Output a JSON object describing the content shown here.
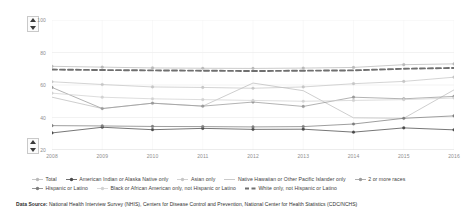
{
  "chart_data": {
    "type": "line",
    "title": "",
    "xlabel": "",
    "ylabel": "percent",
    "ylim": [
      20,
      100
    ],
    "yticks": [
      20,
      40,
      60,
      80,
      100
    ],
    "grid": true,
    "legend_position": "bottom",
    "categories": [
      "2008",
      "2009",
      "2010",
      "2011",
      "2012",
      "2013",
      "2014",
      "2015",
      "2016"
    ],
    "series": [
      {
        "name": "Total",
        "color": "#b9b9b9",
        "marker": "circle",
        "style": "solid",
        "values": [
          71.5,
          71.0,
          70.5,
          70.3,
          70.2,
          70.4,
          70.8,
          72.5,
          73.0
        ]
      },
      {
        "name": "American Indian or Alaska Native only",
        "color": "#4a4a4a",
        "marker": "circle",
        "style": "solid",
        "values": [
          30.5,
          34.0,
          32.5,
          33.3,
          32.7,
          32.8,
          31.0,
          33.6,
          32.4
        ]
      },
      {
        "name": "Asian only",
        "color": "#c6c6c6",
        "marker": "circle",
        "style": "solid",
        "values": [
          62.0,
          60.3,
          58.8,
          58.5,
          58.0,
          58.8,
          60.8,
          62.2,
          64.8
        ]
      },
      {
        "name": "Native Hawaiian or Other Pacific Islander only",
        "color": "#bdbdbd",
        "marker": "none",
        "style": "solid",
        "values": [
          52.5,
          45.5,
          48.8,
          47.0,
          61.2,
          56.5,
          39.8,
          39.5,
          57.0
        ]
      },
      {
        "name": "2 or more races",
        "color": "#9a9a9a",
        "marker": "circle",
        "style": "solid",
        "values": [
          58.5,
          45.5,
          48.8,
          47.0,
          49.5,
          46.8,
          52.5,
          51.5,
          53.0
        ]
      },
      {
        "name": "Hispanic or Latino",
        "color": "#7d7d7d",
        "marker": "circle",
        "style": "solid",
        "values": [
          35.0,
          34.8,
          34.5,
          34.4,
          34.2,
          34.4,
          36.0,
          39.5,
          41.0
        ]
      },
      {
        "name": "Black or African American only, not Hispanic or Latino",
        "color": "#d2d2d2",
        "marker": "circle",
        "style": "solid",
        "values": [
          55.0,
          52.5,
          51.5,
          51.0,
          50.5,
          50.0,
          50.5,
          51.0,
          52.0
        ]
      },
      {
        "name": "White only, not Hispanic or Latino",
        "color": "#6f6f6f",
        "marker": "dash",
        "style": "dashed",
        "values": [
          69.5,
          69.2,
          69.0,
          68.8,
          68.6,
          68.8,
          69.0,
          70.0,
          70.5
        ]
      }
    ]
  },
  "axis": {
    "ylabel": "percent",
    "ticks_y": [
      "100",
      "80",
      "60",
      "40",
      "20"
    ],
    "ticks_x": [
      "2008",
      "2009",
      "2010",
      "2011",
      "2012",
      "2013",
      "2014",
      "2015",
      "2016"
    ]
  },
  "legend": {
    "row1": [
      "Total",
      "American Indian or Alaska Native only",
      "Asian only",
      "Native Hawaiian or Other Pacific Islander only",
      "2 or more races"
    ],
    "row2": [
      "Hispanic or Latino",
      "Black or African American only, not Hispanic or Latino",
      "White only, not Hispanic or Latino"
    ]
  },
  "footer": {
    "label": "Data Source:",
    "text": " National Health Interview Survey (NHIS), Centers for Disease Control and Prevention, National Center for Health Statistics (CDC/NCHS)"
  },
  "controls": {
    "scroll_up": "▲",
    "scroll_down": "▼"
  }
}
